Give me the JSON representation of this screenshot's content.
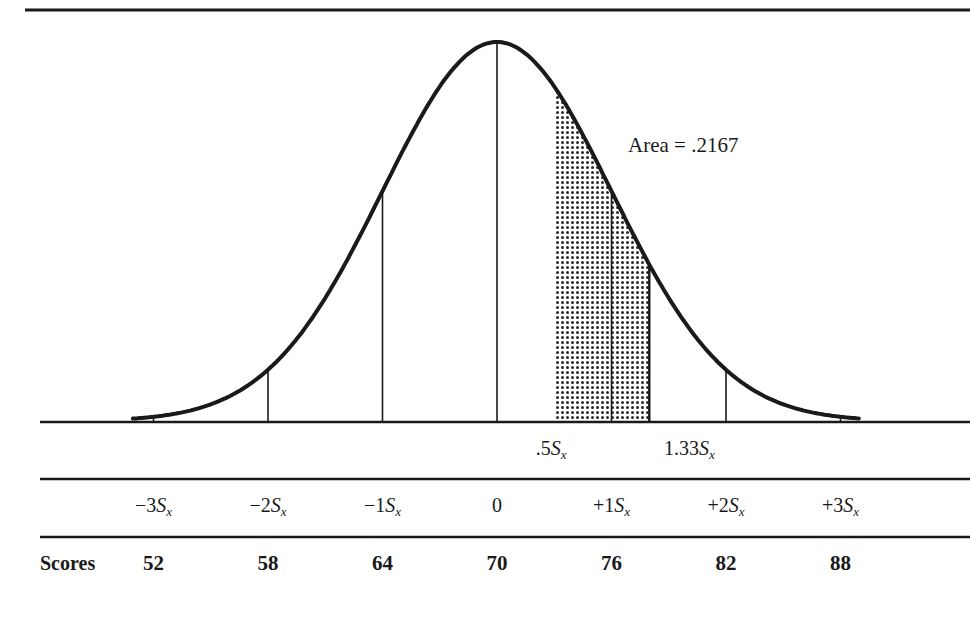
{
  "chart_data": {
    "type": "area",
    "title": "",
    "mean": 70,
    "sd": 6,
    "shaded_region": {
      "from_z": 0.5,
      "to_z": 1.33,
      "area": 0.2167,
      "label": "Area = .2167"
    },
    "sd_ticks": [
      "−3",
      "−2",
      "−1",
      "0",
      "+1",
      "+2",
      "+3"
    ],
    "z": [
      -3,
      -2,
      -1,
      0,
      1,
      2,
      3
    ],
    "scores": [
      52,
      58,
      64,
      70,
      76,
      82,
      88
    ],
    "shade_labels": [
      ".5",
      "1.33"
    ],
    "row_label": "Scores",
    "sd_symbol": "S",
    "sd_subscript": "x",
    "grid": false
  },
  "annotation": {
    "area_text": "Area = .2167"
  },
  "marker_labels": [
    {
      "prefix": ".5",
      "sym": "S",
      "sub": "x"
    },
    {
      "prefix": "1.33",
      "sym": "S",
      "sub": "x"
    }
  ],
  "sd_labels": [
    {
      "prefix": "−3",
      "sym": "S",
      "sub": "x"
    },
    {
      "prefix": "−2",
      "sym": "S",
      "sub": "x"
    },
    {
      "prefix": "−1",
      "sym": "S",
      "sub": "x"
    },
    {
      "prefix": "0",
      "sym": "",
      "sub": ""
    },
    {
      "prefix": "+1",
      "sym": "S",
      "sub": "x"
    },
    {
      "prefix": "+2",
      "sym": "S",
      "sub": "x"
    },
    {
      "prefix": "+3",
      "sym": "S",
      "sub": "x"
    }
  ],
  "scores_row": {
    "label": "Scores",
    "values": [
      "52",
      "58",
      "64",
      "70",
      "76",
      "82",
      "88"
    ]
  }
}
